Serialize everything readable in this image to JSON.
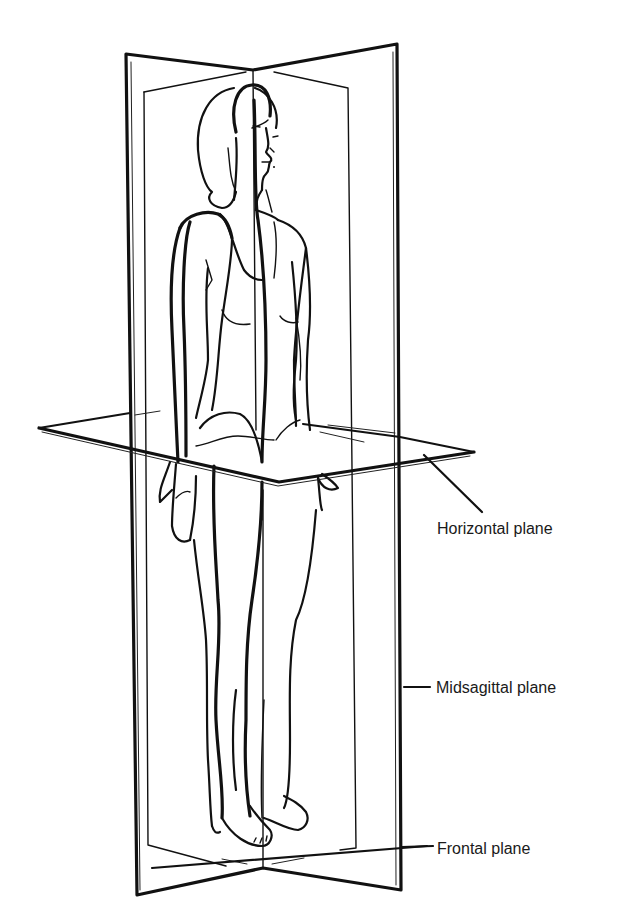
{
  "figure": {
    "labels": [
      {
        "id": "horizontal",
        "text": "Horizontal plane"
      },
      {
        "id": "midsagittal",
        "text": "Midsagittal plane"
      },
      {
        "id": "frontal",
        "text": "Frontal plane"
      }
    ],
    "colors": {
      "background": "#ffffff",
      "ink": "#111111"
    }
  }
}
